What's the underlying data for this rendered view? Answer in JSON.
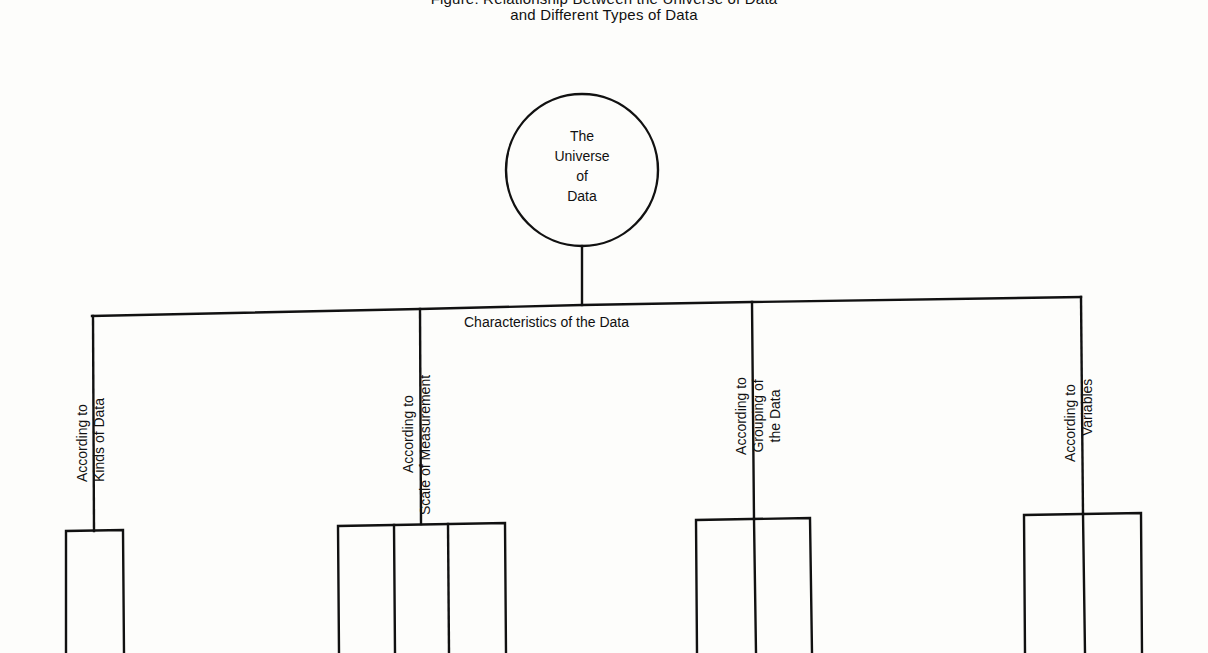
{
  "figure": {
    "title_lines": [
      "Figure: Relationship Between the Universe of Data",
      "and Different Types of Data"
    ],
    "root": {
      "label_lines": [
        "The",
        "Universe",
        "of",
        "Data"
      ]
    },
    "connector_label": "Characteristics of the Data",
    "branches": [
      {
        "label_lines": [
          "According to",
          "Kinds of Data"
        ],
        "subdivisions": 1
      },
      {
        "label_lines": [
          "According to",
          "Scale of Measurement"
        ],
        "subdivisions": 3
      },
      {
        "label_lines": [
          "According to",
          "Grouping of",
          "the Data"
        ],
        "subdivisions": 2
      },
      {
        "label_lines": [
          "According to",
          "Variables"
        ],
        "subdivisions": 2
      }
    ],
    "colors": {
      "line": "#111111",
      "background": "#fdfdfb"
    }
  }
}
